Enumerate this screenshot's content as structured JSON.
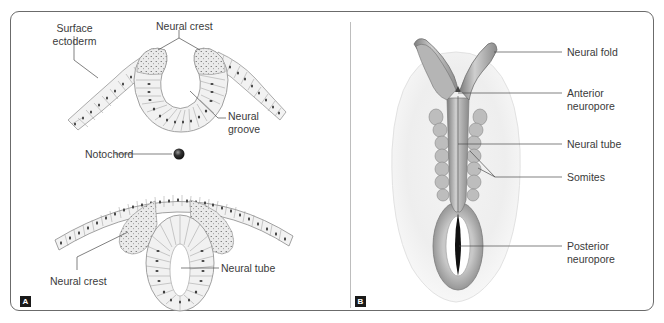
{
  "figure": {
    "panels": [
      {
        "id": "A",
        "badge": "A",
        "labels": {
          "surface_ectoderm_line1": "Surface",
          "surface_ectoderm_line2": "ectoderm",
          "neural_crest_top": "Neural crest",
          "neural_groove_line1": "Neural",
          "neural_groove_line2": "groove",
          "notochord": "Notochord",
          "neural_crest_bottom": "Neural crest",
          "neural_tube": "Neural tube"
        }
      },
      {
        "id": "B",
        "badge": "B",
        "labels": {
          "neural_fold": "Neural fold",
          "anterior_neuropore_line1": "Anterior",
          "anterior_neuropore_line2": "neuropore",
          "neural_tube": "Neural tube",
          "somites": "Somites",
          "posterior_neuropore_line1": "Posterior",
          "posterior_neuropore_line2": "neuropore"
        }
      }
    ]
  },
  "colors": {
    "frame": "#6b6b6b",
    "cell_fill": "#f1f1f1",
    "cell_stroke": "#8a8a8a",
    "nucleus": "#3c3c3c",
    "crest_fill": "#d6d6d6",
    "embryo_dark": "#8c8c8c",
    "embryo_halo": "#ececec",
    "badge_bg": "#1a1a1a"
  }
}
